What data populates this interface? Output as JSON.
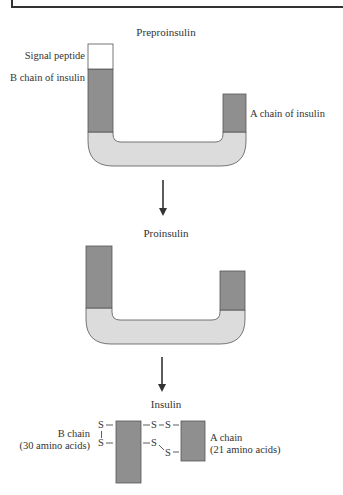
{
  "diagram": {
    "stages": [
      {
        "id": "preproinsulin",
        "title": "Preproinsulin"
      },
      {
        "id": "proinsulin",
        "title": "Proinsulin"
      },
      {
        "id": "insulin",
        "title": "Insulin"
      }
    ],
    "preproinsulin_labels": {
      "signal_peptide": "Signal peptide",
      "b_chain": "B chain of insulin",
      "a_chain": "A chain of insulin"
    },
    "insulin_labels": {
      "b_chain": "B chain",
      "b_chain_count": "(30 amino acids)",
      "a_chain": "A chain",
      "a_chain_count": "(21 amino acids)",
      "disulfide": {
        "s_left_top": "S",
        "s_left_bottom": "S",
        "bridge_top": "S–S",
        "bridge_bottom": "S S"
      }
    },
    "colors": {
      "chain_dark": "#8f8f8f",
      "c_peptide_light": "#dcdcdc",
      "signal_peptide": "#ffffff",
      "outline": "#555555"
    }
  }
}
